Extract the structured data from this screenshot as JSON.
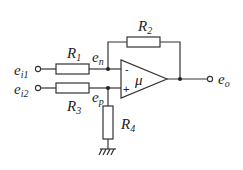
{
  "diagram": {
    "type": "op-amp differential amplifier circuit",
    "labels": {
      "e_i1": {
        "base": "e",
        "sub": "i1"
      },
      "e_i2": {
        "base": "e",
        "sub": "i2"
      },
      "e_n": {
        "base": "e",
        "sub": "n"
      },
      "e_p": {
        "base": "e",
        "sub": "p"
      },
      "e_o": {
        "base": "e",
        "sub": "o"
      },
      "R1": {
        "base": "R",
        "sub": "1"
      },
      "R2": {
        "base": "R",
        "sub": "2"
      },
      "R3": {
        "base": "R",
        "sub": "3"
      },
      "R4": {
        "base": "R",
        "sub": "4"
      },
      "gain": "μ",
      "minus": "-",
      "plus": "+"
    },
    "components": [
      {
        "id": "R1",
        "from": "e_i1",
        "to": "e_n"
      },
      {
        "id": "R2",
        "from": "e_n",
        "to": "e_o",
        "role": "feedback"
      },
      {
        "id": "R3",
        "from": "e_i2",
        "to": "e_p"
      },
      {
        "id": "R4",
        "from": "e_p",
        "to": "ground"
      },
      {
        "id": "opamp",
        "inverting": "e_n",
        "non_inverting": "e_p",
        "output": "e_o",
        "gain": "μ"
      }
    ],
    "colors": {
      "line": "#333333",
      "text": "#222222",
      "background": "#ffffff"
    }
  }
}
